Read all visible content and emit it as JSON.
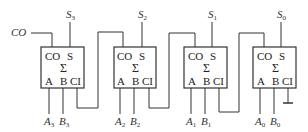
{
  "diagram": {
    "carry_out_label": "CO",
    "adders": [
      {
        "id": "adder-3",
        "x": 41,
        "pins": {
          "co": "CO",
          "s": "S",
          "a": "A",
          "b": "B",
          "ci": "CI"
        },
        "symbol": "Σ",
        "sum_output": {
          "letter": "S",
          "sub": "3"
        },
        "in_a": {
          "letter": "A",
          "sub": "3"
        },
        "in_b": {
          "letter": "B",
          "sub": "3"
        }
      },
      {
        "id": "adder-2",
        "x": 114,
        "pins": {
          "co": "CO",
          "s": "S",
          "a": "A",
          "b": "B",
          "ci": "CI"
        },
        "symbol": "Σ",
        "sum_output": {
          "letter": "S",
          "sub": "2"
        },
        "in_a": {
          "letter": "A",
          "sub": "2"
        },
        "in_b": {
          "letter": "B",
          "sub": "2"
        }
      },
      {
        "id": "adder-1",
        "x": 184,
        "pins": {
          "co": "CO",
          "s": "S",
          "a": "A",
          "b": "B",
          "ci": "CI"
        },
        "symbol": "Σ",
        "sum_output": {
          "letter": "S",
          "sub": "1"
        },
        "in_a": {
          "letter": "A",
          "sub": "1"
        },
        "in_b": {
          "letter": "B",
          "sub": "1"
        }
      },
      {
        "id": "adder-0",
        "x": 253,
        "pins": {
          "co": "CO",
          "s": "S",
          "a": "A",
          "b": "B",
          "ci": "CI"
        },
        "symbol": "Σ",
        "sum_output": {
          "letter": "S",
          "sub": "0"
        },
        "in_a": {
          "letter": "A",
          "sub": "0"
        },
        "in_b": {
          "letter": "B",
          "sub": "0"
        }
      }
    ],
    "lowest_carry_in": "ground"
  }
}
